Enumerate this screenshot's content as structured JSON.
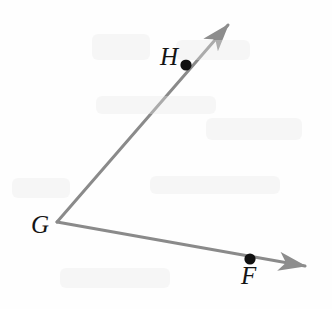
{
  "figure": {
    "type": "geometry-diagram",
    "width": 332,
    "height": 309,
    "background_color": "#fefefe",
    "ray_color": "#8a8a8a",
    "point_color": "#111111",
    "label_color": "#141414",
    "ray_width": 3,
    "point_radius": 5.5,
    "vertex": {
      "name": "G",
      "label": "G",
      "x": 57,
      "y": 222
    },
    "points": [
      {
        "name": "H",
        "label": "H",
        "x": 186,
        "y": 65,
        "label_x": 170,
        "label_y": 56
      },
      {
        "name": "F",
        "label": "F",
        "x": 250,
        "y": 259,
        "label_x": 251,
        "label_y": 275
      }
    ],
    "rays": [
      {
        "name": "ray-GH",
        "from": "G",
        "through": "H",
        "start_x": 57,
        "start_y": 222,
        "tip_x": 233,
        "tip_y": 19,
        "arrowhead": true
      },
      {
        "name": "ray-GF",
        "from": "G",
        "through": "F",
        "start_x": 57,
        "start_y": 222,
        "tip_x": 312,
        "tip_y": 268,
        "arrowhead": true
      }
    ]
  }
}
